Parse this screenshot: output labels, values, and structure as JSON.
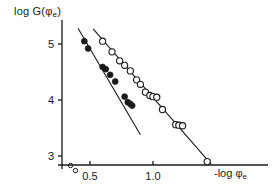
{
  "chart_data": {
    "type": "scatter",
    "title": "",
    "xlabel": "-log φe",
    "xlabel_main": "-log",
    "xlabel_phi": "φ",
    "xlabel_sub": "e",
    "ylabel": "log G(φe)",
    "ylabel_main": "log G(",
    "ylabel_phi": "φ",
    "ylabel_sub": "e",
    "ylabel_close": ")",
    "xlim": [
      0.33,
      1.48
    ],
    "ylim": [
      2.72,
      5.45
    ],
    "xticks": [
      0.5,
      1.0
    ],
    "xtick_labels": [
      "0.5",
      "1.0"
    ],
    "yticks": [
      3,
      4,
      5
    ],
    "ytick_labels": [
      "3",
      "4",
      "5"
    ],
    "grid": false,
    "legend": "none",
    "axis_color": "#1a1a1a",
    "marker_color": "#1a1a1a",
    "line_color": "#1a1a1a",
    "series": [
      {
        "name": "filled-circles",
        "marker": "filled-circle",
        "x": [
          0.455,
          0.485,
          0.6,
          0.625,
          0.66,
          0.7,
          0.775,
          0.8,
          0.82,
          0.835
        ],
        "y": [
          5.05,
          4.92,
          4.59,
          4.55,
          4.45,
          4.33,
          4.06,
          3.96,
          3.93,
          3.9
        ]
      },
      {
        "name": "open-circles",
        "marker": "open-circle",
        "x": [
          0.6,
          0.675,
          0.735,
          0.775,
          0.82,
          0.87,
          0.9,
          0.94,
          0.975,
          1.0,
          1.03,
          1.075,
          1.18,
          1.205,
          1.235,
          1.43
        ],
        "y": [
          5.05,
          4.86,
          4.7,
          4.62,
          4.52,
          4.36,
          4.28,
          4.14,
          4.08,
          4.06,
          4.05,
          3.83,
          3.56,
          3.55,
          3.54,
          2.9
        ]
      }
    ],
    "fit_lines": [
      {
        "name": "filled-fit",
        "x1": 0.405,
        "y1": 5.28,
        "x2": 0.9,
        "y2": 3.38
      },
      {
        "name": "open-fit",
        "x1": 0.525,
        "y1": 5.27,
        "x2": 1.46,
        "y2": 2.86
      }
    ],
    "origin_markers": [
      {
        "name": "origin-marker-filled",
        "x": 0.345,
        "y": 2.83
      },
      {
        "name": "origin-marker-open",
        "x": 0.385,
        "y": 2.74
      }
    ]
  }
}
